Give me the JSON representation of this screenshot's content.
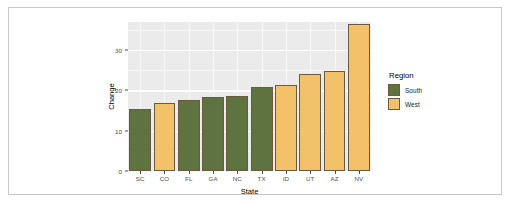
{
  "chart_data": {
    "type": "bar",
    "title": "",
    "xlabel": "State",
    "ylabel": "Change",
    "categories": [
      "SC",
      "CO",
      "FL",
      "GA",
      "NC",
      "TX",
      "ID",
      "UT",
      "AZ",
      "NV"
    ],
    "values": [
      15.4,
      16.9,
      17.7,
      18.5,
      18.7,
      20.8,
      21.3,
      24.1,
      24.9,
      36.5
    ],
    "group_by_category": [
      "South",
      "West",
      "South",
      "South",
      "South",
      "South",
      "West",
      "West",
      "West",
      "West"
    ],
    "series": [
      {
        "name": "South",
        "color": "#5f7340",
        "points": [
          {
            "x": "SC",
            "y": 15.4
          },
          {
            "x": "FL",
            "y": 17.7
          },
          {
            "x": "GA",
            "y": 18.5
          },
          {
            "x": "NC",
            "y": 18.7
          },
          {
            "x": "TX",
            "y": 20.8
          }
        ]
      },
      {
        "name": "West",
        "color": "#f3c169",
        "points": [
          {
            "x": "CO",
            "y": 16.9
          },
          {
            "x": "ID",
            "y": 21.3
          },
          {
            "x": "UT",
            "y": 24.1
          },
          {
            "x": "AZ",
            "y": 24.9
          },
          {
            "x": "NV",
            "y": 36.5
          }
        ]
      }
    ],
    "ylim": [
      0,
      37.0
    ],
    "yticks": [
      0,
      10,
      20,
      30
    ],
    "ytick_labels": [
      "0",
      "10",
      "20",
      "30"
    ],
    "y_minor_ticks": [
      5,
      15,
      25,
      35
    ],
    "grid": true,
    "legend_position": "right",
    "panel_background": "#ebebeb",
    "grid_color": "#ffffff",
    "bar_outline_color": "#6b5a3e"
  },
  "legend": {
    "title": "Region",
    "entries": [
      {
        "label": "South",
        "color": "#5f7340"
      },
      {
        "label": "West",
        "color": "#f3c169"
      }
    ]
  },
  "axes": {
    "x_title": "State",
    "y_title": "Change"
  }
}
